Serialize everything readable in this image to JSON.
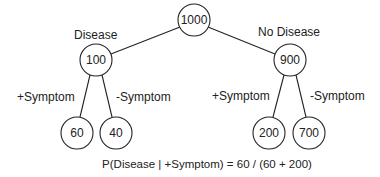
{
  "diagram": {
    "type": "probability-tree",
    "nodes": {
      "root": {
        "value": "1000"
      },
      "disease": {
        "value": "100",
        "label": "Disease"
      },
      "no_disease": {
        "value": "900",
        "label": "No Disease"
      },
      "disease_pos": {
        "value": "60",
        "label": "+Symptom"
      },
      "disease_neg": {
        "value": "40",
        "label": "-Symptom"
      },
      "nodisease_pos": {
        "value": "200",
        "label": "+Symptom"
      },
      "nodisease_neg": {
        "value": "700",
        "label": "-Symptom"
      }
    },
    "edges": [
      {
        "from": "root",
        "to": "disease"
      },
      {
        "from": "root",
        "to": "no_disease"
      },
      {
        "from": "disease",
        "to": "disease_pos"
      },
      {
        "from": "disease",
        "to": "disease_neg"
      },
      {
        "from": "no_disease",
        "to": "nodisease_pos"
      },
      {
        "from": "no_disease",
        "to": "nodisease_neg"
      }
    ],
    "formula": "P(Disease | +Symptom) = 60 / (60 + 200)"
  }
}
